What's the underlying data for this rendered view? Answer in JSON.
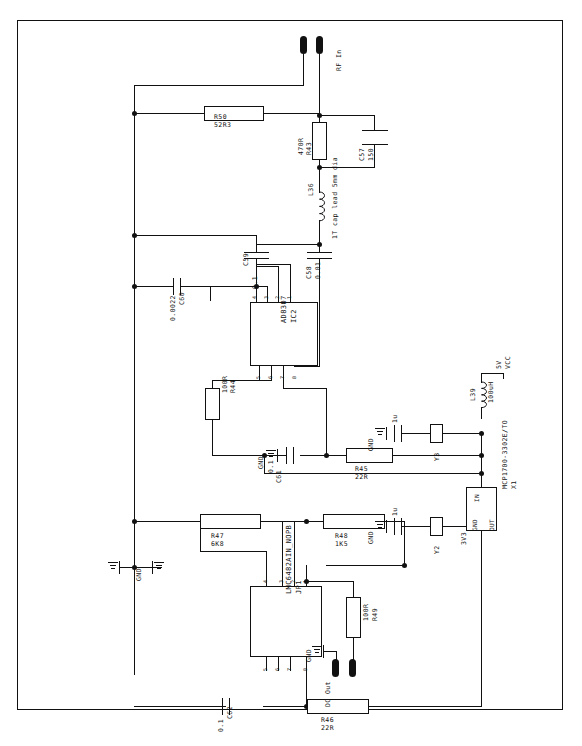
{
  "sheet": {
    "title": "RF log detector schematic",
    "border_color": "#111111",
    "background": "#ffffff"
  },
  "ports": [
    {
      "name": "rf-in",
      "label": "RF In",
      "x": 302,
      "y": 33
    },
    {
      "name": "dc-out",
      "label": "DC Out",
      "x": 330,
      "y": 648
    }
  ],
  "power": {
    "vcc_label": "VCC",
    "vcc_value": "5V",
    "rail_3v3": "3V3"
  },
  "components": {
    "resistors": [
      {
        "ref": "R50",
        "value": "52R3"
      },
      {
        "ref": "R43",
        "value": "470R"
      },
      {
        "ref": "R44",
        "value": "100R"
      },
      {
        "ref": "R45",
        "value": "22R"
      },
      {
        "ref": "R46",
        "value": "22R"
      },
      {
        "ref": "R47",
        "value": "6K8"
      },
      {
        "ref": "R48",
        "value": "1K5"
      },
      {
        "ref": "R49",
        "value": "100R"
      }
    ],
    "capacitors": [
      {
        "ref": "C57",
        "value": "150"
      },
      {
        "ref": "C58",
        "value": "0.01"
      },
      {
        "ref": "C59",
        "value": "0.1"
      },
      {
        "ref": "C60",
        "value": "0.0022"
      },
      {
        "ref": "C61",
        "value": "0.1"
      },
      {
        "ref": "C62",
        "value": "0.1"
      },
      {
        "ref": "Y3",
        "value": "1u"
      },
      {
        "ref": "Y2",
        "value": "1u"
      }
    ],
    "inductors": [
      {
        "ref": "L36",
        "value": ""
      },
      {
        "ref": "L39",
        "value": "100uH"
      }
    ],
    "ics": [
      {
        "ref": "IC2",
        "part": "AD8307"
      },
      {
        "ref": "JP1",
        "part": "LMC6482AIN_NOPB"
      },
      {
        "ref": "X1",
        "part": "MCP1700-3302E/TO",
        "pins": [
          "IN",
          "GND",
          "OUT"
        ]
      }
    ]
  },
  "annotations": [
    {
      "name": "cap-lead-note",
      "text": "1T cap lead 5mm dia"
    }
  ],
  "grounds": [
    {
      "name": "gnd-c60",
      "label": "GND"
    },
    {
      "name": "gnd-c61",
      "label": "GND"
    },
    {
      "name": "gnd-y3",
      "label": "GND"
    },
    {
      "name": "gnd-y2",
      "label": "GND"
    },
    {
      "name": "gnd-jp1",
      "label": "GND"
    },
    {
      "name": "gnd-dcout",
      "label": "GND"
    }
  ],
  "pin_numbers": {
    "ic2_top": [
      "4",
      "3",
      "2",
      "1"
    ],
    "ic2_bottom": [
      "5",
      "6",
      "7",
      "8"
    ],
    "jp1_top": [
      "4",
      "3",
      "2",
      "1"
    ],
    "jp1_bottom": [
      "5",
      "6",
      "7",
      "8"
    ]
  },
  "caption": ""
}
